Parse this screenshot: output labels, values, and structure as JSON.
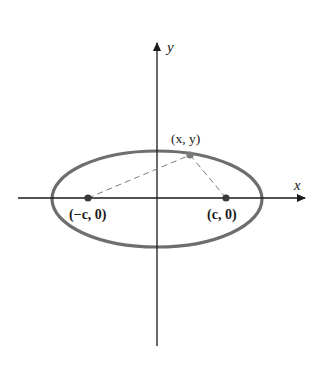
{
  "diagram": {
    "type": "ellipse-foci",
    "axes": {
      "x_label": "x",
      "y_label": "y"
    },
    "ellipse": {
      "center": [
        0,
        0
      ],
      "stroke_color": "#6e6e6e"
    },
    "points": {
      "left_focus": {
        "label": "(−c, 0)"
      },
      "right_focus": {
        "label": "(c, 0)"
      },
      "point_on_ellipse": {
        "label": "(x, y)"
      }
    },
    "colors": {
      "axis": "#1a1a1a",
      "ellipse": "#6e6e6e",
      "dashed_lines": "#7a7a7a",
      "focus_dot": "#3a3a3a",
      "point_dot": "#7a7a7a"
    }
  }
}
